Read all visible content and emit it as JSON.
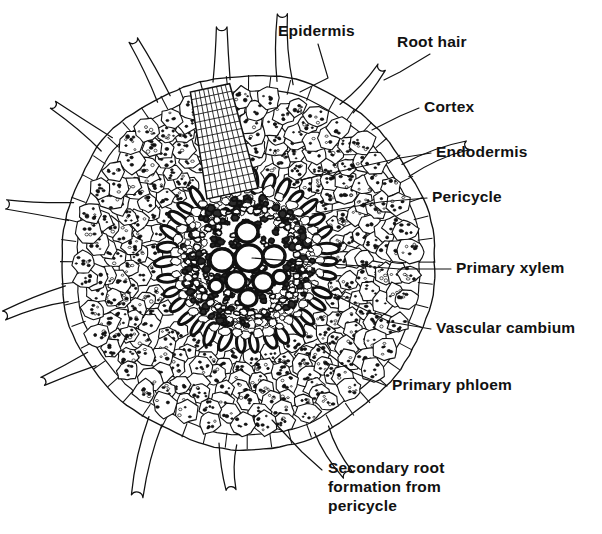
{
  "figure": {
    "kind": "botanical-diagram",
    "background_color": "#ffffff",
    "ink_color": "#111111",
    "label_font_size_px": 15.5
  },
  "labels": [
    {
      "id": "epidermis",
      "text": "Epidermis",
      "x": 278,
      "y": 22,
      "align": "left",
      "leader": [
        [
          318,
          44
        ],
        [
          328,
          78
        ],
        [
          300,
          92
        ]
      ]
    },
    {
      "id": "root-hair",
      "text": "Root hair",
      "x": 397,
      "y": 33,
      "align": "left",
      "leader": [
        [
          430,
          54
        ],
        [
          400,
          72
        ],
        [
          384,
          80
        ]
      ]
    },
    {
      "id": "cortex",
      "text": "Cortex",
      "x": 424,
      "y": 98,
      "align": "left",
      "leader": [
        [
          419,
          108
        ],
        [
          400,
          116
        ],
        [
          372,
          130
        ]
      ]
    },
    {
      "id": "endodermis",
      "text": "Endodermis",
      "x": 436,
      "y": 143,
      "align": "left",
      "leader": [
        [
          431,
          153
        ],
        [
          400,
          158
        ],
        [
          300,
          180
        ]
      ]
    },
    {
      "id": "pericycle",
      "text": "Pericycle",
      "x": 432,
      "y": 188,
      "align": "left",
      "leader": [
        [
          427,
          198
        ],
        [
          380,
          202
        ],
        [
          312,
          214
        ]
      ]
    },
    {
      "id": "primary-xylem",
      "text": "Primary xylem",
      "x": 456,
      "y": 259,
      "align": "left",
      "leader": [
        [
          451,
          269
        ],
        [
          400,
          269
        ],
        [
          252,
          258
        ]
      ]
    },
    {
      "id": "vascular-cambium",
      "text": "Vascular cambium",
      "x": 436,
      "y": 319,
      "align": "left",
      "leader": [
        [
          431,
          329
        ],
        [
          390,
          322
        ],
        [
          300,
          278
        ]
      ]
    },
    {
      "id": "primary-phloem",
      "text": "Primary phloem",
      "x": 392,
      "y": 376,
      "align": "left",
      "leader": [
        [
          387,
          386
        ],
        [
          352,
          372
        ],
        [
          316,
          344
        ]
      ]
    },
    {
      "id": "secondary-root",
      "text": "Secondary root\nformation from\npericycle",
      "x": 328,
      "y": 458,
      "align": "left",
      "leader": [
        [
          322,
          470
        ],
        [
          302,
          452
        ],
        [
          272,
          420
        ]
      ]
    }
  ],
  "anatomy": {
    "root_center": {
      "cx": 247,
      "cy": 262
    },
    "radii": {
      "epidermis_outer": 187,
      "epidermis_inner": 172,
      "cortex_outer": 172,
      "cortex_inner": 86,
      "endodermis_outer": 86,
      "endodermis_inner": 76,
      "pericycle_inner": 70,
      "stele": 70,
      "xylem_core": 40
    },
    "tissues": [
      {
        "name": "Epidermis",
        "note": "single outer layer of tangentially elongated cells bearing root hairs"
      },
      {
        "name": "Root hair",
        "note": "tubular outgrowth of an epidermal cell",
        "count": 12
      },
      {
        "name": "Cortex",
        "note": "many layers of large rounded parenchyma cells with starch grains"
      },
      {
        "name": "Endodermis",
        "note": "ring of thick-walled darkly stained cells"
      },
      {
        "name": "Pericycle",
        "note": "layer just inside endodermis; gives rise to secondary roots"
      },
      {
        "name": "Primary xylem",
        "note": "large open vessels in centre of stele",
        "vessel_count": 9
      },
      {
        "name": "Vascular cambium",
        "note": "thin zone between xylem and phloem"
      },
      {
        "name": "Primary phloem",
        "note": "small dense cells outside the xylem"
      },
      {
        "name": "Secondary root",
        "note": "primordium of lateral root emerging downward through the cortex"
      }
    ],
    "root_hair_angles_deg": [
      96,
      120,
      148,
      170,
      196,
      220,
      243,
      262,
      282,
      303,
      330,
      66
    ],
    "xylem_vessels": [
      {
        "dx": 0,
        "dy": -30,
        "r": 11
      },
      {
        "dx": 2,
        "dy": -4,
        "r": 14
      },
      {
        "dx": -25,
        "dy": -2,
        "r": 12
      },
      {
        "dx": 27,
        "dy": -6,
        "r": 11
      },
      {
        "dx": -11,
        "dy": 19,
        "r": 10
      },
      {
        "dx": 16,
        "dy": 20,
        "r": 10
      },
      {
        "dx": 1,
        "dy": 36,
        "r": 9
      },
      {
        "dx": -31,
        "dy": 24,
        "r": 7
      },
      {
        "dx": 33,
        "dy": 15,
        "r": 7
      }
    ],
    "secondary_root": {
      "direction_deg": 258,
      "top_half_width": 26,
      "bottom_half_width": 20,
      "length": 108,
      "cell_rows": 14,
      "cell_cols": 9
    }
  }
}
